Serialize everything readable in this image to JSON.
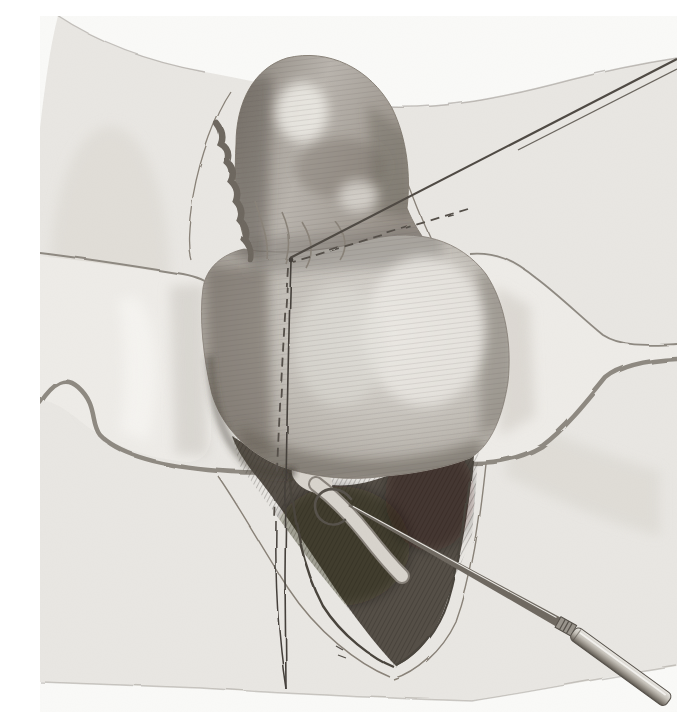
{
  "meta": {
    "type": "hand-drawn surgical illustration"
  },
  "scene": {
    "elements": [
      {
        "name": "surgical-drape",
        "label": "surgical drape / field cloth"
      },
      {
        "name": "pericardium-opening",
        "label": "opened pericardial sac outline"
      },
      {
        "name": "retractor-left",
        "label": "left retractor blade spreading wound"
      },
      {
        "name": "retractor-right",
        "label": "right retractor blade spreading wound"
      },
      {
        "name": "heart-upper-lobe",
        "label": "upturned cardiac apex / appendage"
      },
      {
        "name": "heart-body",
        "label": "ventricular mass of the heart"
      },
      {
        "name": "pericardial-cut-edge",
        "label": "rough cut edge of pericardium"
      },
      {
        "name": "wound-cavity",
        "label": "dark lower pericardial cavity"
      },
      {
        "name": "vena-cava-tube",
        "label": "pale vessel within cavity"
      },
      {
        "name": "ligature-needle",
        "label": "long straight ligature needle"
      },
      {
        "name": "incision-dashed-line",
        "label": "dashed planned incision line"
      },
      {
        "name": "suture-thread",
        "label": "double suture thread"
      },
      {
        "name": "probe-instrument",
        "label": "hooked dissecting probe with handle"
      }
    ]
  },
  "palette": {
    "paper": "#fafaf8",
    "drape": "#e9e7e3",
    "pericardium_line": "#8a8379",
    "retractor_fill": "#eeece8",
    "retractor_edge": "#8f8a82",
    "heart_light": "#e4e1dc",
    "heart_mid": "#c2beb7",
    "heart_dark": "#8a847c",
    "scallop": "#6e6860",
    "cavity": "#554f47",
    "tube": "#d8d4cd",
    "metal_light": "#edebe6",
    "metal_dark": "#5d5850",
    "thread": "#45403b",
    "needle": "#4f4a44"
  }
}
